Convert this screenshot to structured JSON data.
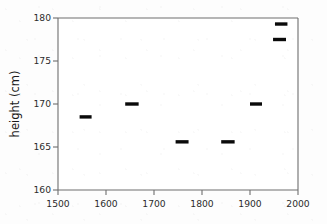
{
  "chart_data": {
    "type": "line",
    "title": "",
    "subtitle": "",
    "xlabel": "",
    "ylabel": "height (cm)",
    "xlim": [
      1500,
      2000
    ],
    "ylim": [
      160,
      180
    ],
    "xticks": [
      1500,
      1600,
      1700,
      1800,
      1900,
      2000
    ],
    "xtick_labels": [
      "1500",
      "1600",
      "1700",
      "1800",
      "1900",
      "2000"
    ],
    "yticks": [
      160,
      165,
      170,
      175,
      180
    ],
    "ytick_labels": [
      "160",
      "165",
      "170",
      "175",
      "180"
    ],
    "grid": false,
    "legend": false,
    "marker_style": "horizontal-segment",
    "series": [
      {
        "name": "mean height",
        "color": "#0a0a0a",
        "segments": [
          {
            "label": "1545-1570",
            "x_start": 1545,
            "x_end": 1570,
            "y": 168.5
          },
          {
            "label": "1640-1668",
            "x_start": 1640,
            "x_end": 1668,
            "y": 170.0
          },
          {
            "label": "1745-1772",
            "x_start": 1745,
            "x_end": 1772,
            "y": 165.6
          },
          {
            "label": "1840-1868",
            "x_start": 1840,
            "x_end": 1868,
            "y": 165.6
          },
          {
            "label": "1900-1925",
            "x_start": 1900,
            "x_end": 1925,
            "y": 170.0
          },
          {
            "label": "1948-1975",
            "x_start": 1948,
            "x_end": 1975,
            "y": 177.5
          },
          {
            "label": "1952-1978",
            "x_start": 1952,
            "x_end": 1978,
            "y": 179.3
          }
        ]
      }
    ]
  },
  "axes": {
    "y_title": "height (cm)",
    "x_title": ""
  }
}
